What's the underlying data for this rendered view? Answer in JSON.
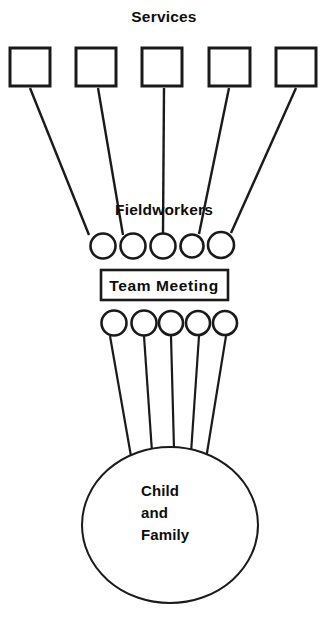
{
  "diagram": {
    "title_top": "Services",
    "title_middle": "Fieldworkers",
    "meeting_label": "Team Meeting",
    "center_label_lines": [
      "Child",
      "and",
      "Family"
    ],
    "background_color": "#ffffff",
    "stroke_color": "#1a1a1a",
    "text_color": "#0d0d0d",
    "services": {
      "count": 5,
      "shape": "square",
      "items": [
        {
          "name": "service-box-1",
          "x": 10,
          "y": 48,
          "w": 40,
          "h": 38
        },
        {
          "name": "service-box-2",
          "x": 76,
          "y": 48,
          "w": 40,
          "h": 38
        },
        {
          "name": "service-box-3",
          "x": 142,
          "y": 48,
          "w": 40,
          "h": 38
        },
        {
          "name": "service-box-4",
          "x": 209,
          "y": 48,
          "w": 41,
          "h": 38
        },
        {
          "name": "service-box-5",
          "x": 276,
          "y": 48,
          "w": 40,
          "h": 38
        }
      ]
    },
    "fieldworkers_upper": {
      "count": 5,
      "shape": "circle",
      "items": [
        {
          "name": "fieldworker-upper-1",
          "cx": 103,
          "cy": 246,
          "r": 12.5
        },
        {
          "name": "fieldworker-upper-2",
          "cx": 133,
          "cy": 246,
          "r": 12.5
        },
        {
          "name": "fieldworker-upper-3",
          "cx": 163,
          "cy": 246,
          "r": 12.5
        },
        {
          "name": "fieldworker-upper-4",
          "cx": 192,
          "cy": 246,
          "r": 11.5
        },
        {
          "name": "fieldworker-upper-5",
          "cx": 221,
          "cy": 245,
          "r": 13.0
        }
      ]
    },
    "fieldworkers_lower": {
      "count": 5,
      "shape": "circle",
      "items": [
        {
          "name": "fieldworker-lower-1",
          "cx": 114,
          "cy": 323,
          "r": 12.5
        },
        {
          "name": "fieldworker-lower-2",
          "cx": 144,
          "cy": 323,
          "r": 12.5
        },
        {
          "name": "fieldworker-lower-3",
          "cx": 171,
          "cy": 323,
          "r": 12.0
        },
        {
          "name": "fieldworker-lower-4",
          "cx": 198,
          "cy": 323,
          "r": 12.0
        },
        {
          "name": "fieldworker-lower-5",
          "cx": 225,
          "cy": 323,
          "r": 12.0
        }
      ]
    },
    "meeting_box": {
      "x": 101,
      "y": 270,
      "w": 127,
      "h": 30
    },
    "center_circle": {
      "cx": 170,
      "cy": 525,
      "rx": 88,
      "ry": 78
    },
    "links_services_to_workers": [
      {
        "name": "link-service-1",
        "x1": 30,
        "y1": 88,
        "x2": 89,
        "y2": 235
      },
      {
        "name": "link-service-2",
        "x1": 98,
        "y1": 88,
        "x2": 123,
        "y2": 235
      },
      {
        "name": "link-service-3",
        "x1": 164,
        "y1": 88,
        "x2": 163,
        "y2": 233
      },
      {
        "name": "link-service-4",
        "x1": 229,
        "y1": 88,
        "x2": 199,
        "y2": 234
      },
      {
        "name": "link-service-5",
        "x1": 296,
        "y1": 88,
        "x2": 231,
        "y2": 233
      }
    ],
    "links_workers_to_family": [
      {
        "name": "link-family-1",
        "x1": 110,
        "y1": 336,
        "x2": 132,
        "y2": 462
      },
      {
        "name": "link-family-2",
        "x1": 144,
        "y1": 336,
        "x2": 152,
        "y2": 452
      },
      {
        "name": "link-family-3",
        "x1": 171,
        "y1": 336,
        "x2": 174,
        "y2": 449
      },
      {
        "name": "link-family-4",
        "x1": 199,
        "y1": 336,
        "x2": 191,
        "y2": 453
      },
      {
        "name": "link-family-5",
        "x1": 226,
        "y1": 336,
        "x2": 206,
        "y2": 459
      }
    ],
    "label_positions": {
      "services": {
        "x": 164,
        "y": 22
      },
      "fieldworkers": {
        "x": 164,
        "y": 215
      },
      "meeting": {
        "x": 164,
        "y": 291
      },
      "family_x": 141,
      "family_y": [
        496,
        518,
        540
      ]
    }
  }
}
